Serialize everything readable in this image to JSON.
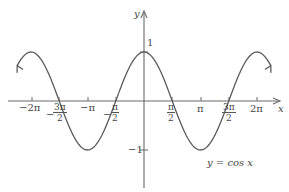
{
  "chart_data": {
    "type": "line",
    "title": "",
    "function": "cos x",
    "annotation": "y = cos x",
    "xlabel": "x",
    "ylabel": "y",
    "xlim": [
      -7.0,
      7.3
    ],
    "ylim": [
      -1.9,
      1.95
    ],
    "grid": false,
    "legend": "none",
    "x_ticks": [
      {
        "value": -6.2832,
        "label": "−2π"
      },
      {
        "value": -4.7124,
        "label": "−3π/2"
      },
      {
        "value": -3.1416,
        "label": "−π"
      },
      {
        "value": -1.5708,
        "label": "−π/2"
      },
      {
        "value": 1.5708,
        "label": "π/2"
      },
      {
        "value": 3.1416,
        "label": "π"
      },
      {
        "value": 4.7124,
        "label": "3π/2"
      },
      {
        "value": 6.2832,
        "label": "2π"
      }
    ],
    "y_ticks": [
      {
        "value": 1,
        "label": "1"
      },
      {
        "value": -1,
        "label": "−1"
      }
    ],
    "series": [
      {
        "name": "y = cos x",
        "x": [
          -7.0,
          -6.2832,
          -4.7124,
          -3.1416,
          -1.5708,
          0,
          1.5708,
          3.1416,
          4.7124,
          6.2832,
          7.0
        ],
        "y": [
          0.754,
          1,
          0,
          -1,
          0,
          1,
          0,
          -1,
          0,
          1,
          0.754
        ],
        "arrows_at_ends": true
      }
    ]
  },
  "labels": {
    "x_axis": "x",
    "y_axis": "y",
    "neg_two_pi": "−2π",
    "neg_pi": "−π",
    "pi": "π",
    "two_pi": "2π",
    "neg_sign": "−",
    "three_pi": "3π",
    "pi_num": "π",
    "two": "2",
    "y_one": "1",
    "y_neg_one": "−1",
    "curve_label": "y = cos x"
  }
}
